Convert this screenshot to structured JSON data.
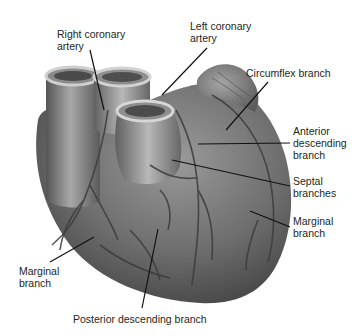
{
  "diagram": {
    "labels": [
      {
        "id": "right-coronary-artery",
        "text": "Right coronary\nartery",
        "x": 57,
        "y": 28
      },
      {
        "id": "left-coronary-artery",
        "text": "Left coronary\nartery",
        "x": 190,
        "y": 20
      },
      {
        "id": "circumflex-branch",
        "text": "Circumflex branch",
        "x": 246,
        "y": 67
      },
      {
        "id": "anterior-descending-branch",
        "text": "Anterior\ndescending\nbranch",
        "x": 293,
        "y": 125
      },
      {
        "id": "septal-branches",
        "text": "Septal\nbranches",
        "x": 293,
        "y": 175
      },
      {
        "id": "marginal-branch-right",
        "text": "Marginal\nbranch",
        "x": 293,
        "y": 215
      },
      {
        "id": "marginal-branch-left",
        "text": "Marginal\nbranch",
        "x": 19,
        "y": 265
      },
      {
        "id": "posterior-descending-branch",
        "text": "Posterior descending branch",
        "x": 73,
        "y": 313
      }
    ],
    "colors": {
      "background": "#ffffff",
      "heart_dark": "#4a4a4a",
      "heart_mid": "#7a7a7a",
      "heart_light": "#b5b5b5",
      "leader_line": "#111111",
      "label_text": "#231f20"
    }
  }
}
